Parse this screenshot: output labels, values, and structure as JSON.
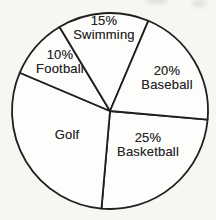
{
  "page": {
    "background_color": "#f6f6f3"
  },
  "chart_data": {
    "type": "pie",
    "title": "",
    "legend": "none",
    "direction": "clockwise",
    "start_angle_deg": 5,
    "center": {
      "x": 110,
      "y": 111
    },
    "radius": 98,
    "fill_color": "#fdfdfb",
    "stroke_color": "#1f1f1f",
    "stroke_width": 1.8,
    "label_color": "#262626",
    "slices": [
      {
        "label": "Basketball",
        "value": 25,
        "percent_text": "25%",
        "label_x": 148,
        "label_y": 145
      },
      {
        "label": "Golf",
        "value": 30,
        "percent_text": "",
        "label_x": 67,
        "label_y": 135
      },
      {
        "label": "Football",
        "value": 10,
        "percent_text": "10%",
        "label_x": 60,
        "label_y": 62
      },
      {
        "label": "Swimming",
        "value": 15,
        "percent_text": "15%",
        "label_x": 104,
        "label_y": 28
      },
      {
        "label": "Baseball",
        "value": 20,
        "percent_text": "20%",
        "label_x": 167,
        "label_y": 78
      }
    ]
  }
}
